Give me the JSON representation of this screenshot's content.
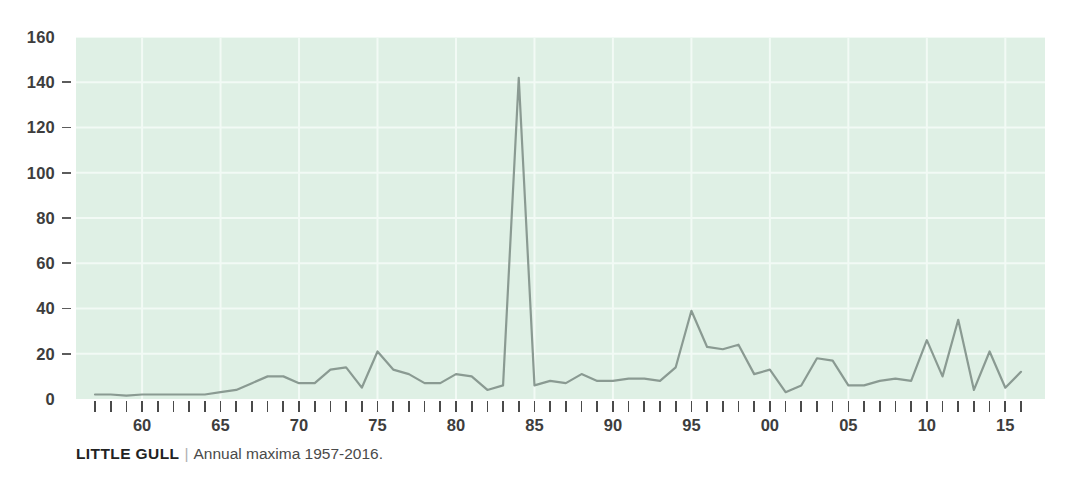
{
  "caption": {
    "species": "LITTLE GULL",
    "separator": "|",
    "description": "Annual maxima 1957-2016."
  },
  "colors": {
    "plot_background": "#dff0e5",
    "line": "#8a9a92",
    "gridline": "#f2faf5",
    "tick": "#4a4a4a",
    "label": "#3d3d3d",
    "page_background": "#ffffff"
  },
  "chart_data": {
    "type": "line",
    "title": "LITTLE GULL",
    "subtitle": "Annual maxima 1957-2016.",
    "xlabel": "",
    "ylabel": "",
    "ylim": [
      0,
      160
    ],
    "xlim": [
      1957,
      2016
    ],
    "grid": true,
    "legend": "none",
    "y_ticks": [
      0,
      20,
      40,
      60,
      80,
      100,
      120,
      140,
      160
    ],
    "y_tick_labels": [
      "0",
      "20",
      "40",
      "60",
      "80",
      "100",
      "120",
      "140",
      "160"
    ],
    "x_ticks": [
      1960,
      1965,
      1970,
      1975,
      1980,
      1985,
      1990,
      1995,
      2000,
      2005,
      2010,
      2015
    ],
    "x_tick_labels": [
      "60",
      "65",
      "70",
      "75",
      "80",
      "85",
      "90",
      "95",
      "00",
      "05",
      "10",
      "15"
    ],
    "x_minor_tick_interval": 1,
    "x": [
      1957,
      1958,
      1959,
      1960,
      1961,
      1962,
      1963,
      1964,
      1965,
      1966,
      1967,
      1968,
      1969,
      1970,
      1971,
      1972,
      1973,
      1974,
      1975,
      1976,
      1977,
      1978,
      1979,
      1980,
      1981,
      1982,
      1983,
      1984,
      1985,
      1986,
      1987,
      1988,
      1989,
      1990,
      1991,
      1992,
      1993,
      1994,
      1995,
      1996,
      1997,
      1998,
      1999,
      2000,
      2001,
      2002,
      2003,
      2004,
      2005,
      2006,
      2007,
      2008,
      2009,
      2010,
      2011,
      2012,
      2013,
      2014,
      2015,
      2016
    ],
    "values": [
      2,
      2,
      1.5,
      2,
      2,
      2,
      2,
      2,
      3,
      4,
      7,
      10,
      10,
      7,
      7,
      13,
      14,
      5,
      21,
      13,
      11,
      7,
      7,
      11,
      10,
      4,
      6,
      142,
      6,
      8,
      7,
      11,
      8,
      8,
      9,
      9,
      8,
      14,
      39,
      23,
      22,
      24,
      11,
      13,
      3,
      6,
      18,
      17,
      6,
      6,
      8,
      9,
      8,
      26,
      10,
      35,
      4,
      21,
      5,
      12
    ],
    "series": [
      {
        "name": "Annual maxima",
        "values": [
          2,
          2,
          1.5,
          2,
          2,
          2,
          2,
          2,
          3,
          4,
          7,
          10,
          10,
          7,
          7,
          13,
          14,
          5,
          21,
          13,
          11,
          7,
          7,
          11,
          10,
          4,
          6,
          142,
          6,
          8,
          7,
          11,
          8,
          8,
          9,
          9,
          8,
          14,
          39,
          23,
          22,
          24,
          11,
          13,
          3,
          6,
          18,
          17,
          6,
          6,
          8,
          9,
          8,
          26,
          10,
          35,
          4,
          21,
          5,
          12
        ]
      }
    ],
    "annotations": [
      {
        "year": 1984,
        "value": 142,
        "note": "peak"
      }
    ]
  }
}
